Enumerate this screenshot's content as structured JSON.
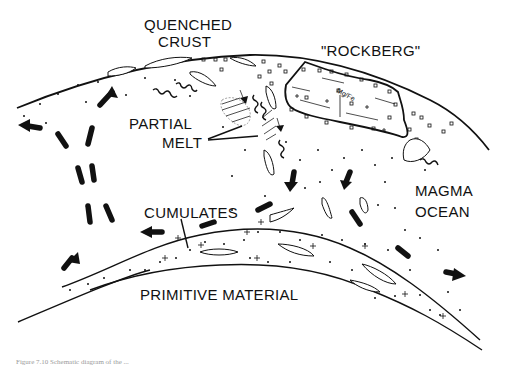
{
  "figure": {
    "labels": {
      "quenched_crust_line1": "QUENCHED",
      "quenched_crust_line2": "CRUST",
      "rockberg": "\"ROCKBERG\"",
      "mg_fe": "Mg/Fe",
      "partial_line1": "PARTIAL",
      "partial_line2": "MELT",
      "magma_line1": "MAGMA",
      "magma_line2": "OCEAN",
      "cumulates": "CUMULATES",
      "primitive_material": "PRIMITIVE MATERIAL"
    },
    "caption": "Figure 7.10  Schematic diagram of the ...",
    "colors": {
      "ink": "#111111",
      "background": "#ffffff",
      "caption": "#9a9a9a"
    }
  }
}
